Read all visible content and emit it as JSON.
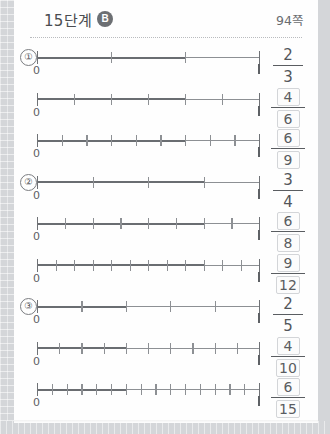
{
  "header": {
    "title": "15단계",
    "badge": "B",
    "page_label": "94쪽"
  },
  "labels": {
    "zero": "0",
    "one": "1"
  },
  "items": [
    {
      "number": "①"
    },
    {
      "number": "②"
    },
    {
      "number": "③"
    }
  ],
  "rows": [
    {
      "item": "①",
      "show_item": true,
      "denominator": 9,
      "numerator": 6,
      "frac_num": "2",
      "frac_den": "3",
      "boxed": false
    },
    {
      "item": "",
      "show_item": false,
      "denominator": 9,
      "numerator": 6,
      "frac_num": "4",
      "frac_den": "6",
      "boxed": true
    },
    {
      "item": "",
      "show_item": false,
      "denominator": 9,
      "numerator": 6,
      "frac_num": "6",
      "frac_den": "9",
      "boxed": true
    },
    {
      "item": "②",
      "show_item": true,
      "denominator": 4,
      "numerator": 3,
      "frac_num": "3",
      "frac_den": "4",
      "boxed": false
    },
    {
      "item": "",
      "show_item": false,
      "denominator": 8,
      "numerator": 6,
      "frac_num": "6",
      "frac_den": "8",
      "boxed": true
    },
    {
      "item": "",
      "show_item": false,
      "denominator": 12,
      "numerator": 9,
      "frac_num": "9",
      "frac_den": "12",
      "boxed": true
    },
    {
      "item": "③",
      "show_item": true,
      "denominator": 5,
      "numerator": 2,
      "frac_num": "2",
      "frac_den": "5",
      "boxed": false
    },
    {
      "item": "",
      "show_item": false,
      "denominator": 10,
      "numerator": 4,
      "frac_num": "4",
      "frac_den": "10",
      "boxed": true
    },
    {
      "item": "",
      "show_item": false,
      "denominator": 15,
      "numerator": 6,
      "frac_num": "6",
      "frac_den": "15",
      "boxed": true
    }
  ],
  "chart_data": {
    "type": "line",
    "xlabel": "",
    "ylabel": "",
    "xlim": [
      0,
      1
    ],
    "grid": false,
    "series": [
      {
        "name": "2/3",
        "divisions": 3,
        "marked": 2,
        "value": 0.6667
      },
      {
        "name": "4/6",
        "divisions": 6,
        "marked": 4,
        "value": 0.6667
      },
      {
        "name": "6/9",
        "divisions": 9,
        "marked": 6,
        "value": 0.6667
      },
      {
        "name": "3/4",
        "divisions": 4,
        "marked": 3,
        "value": 0.75
      },
      {
        "name": "6/8",
        "divisions": 8,
        "marked": 6,
        "value": 0.75
      },
      {
        "name": "9/12",
        "divisions": 12,
        "marked": 9,
        "value": 0.75
      },
      {
        "name": "2/5",
        "divisions": 5,
        "marked": 2,
        "value": 0.4
      },
      {
        "name": "4/10",
        "divisions": 10,
        "marked": 4,
        "value": 0.4
      },
      {
        "name": "6/15",
        "divisions": 15,
        "marked": 6,
        "value": 0.4
      }
    ]
  }
}
